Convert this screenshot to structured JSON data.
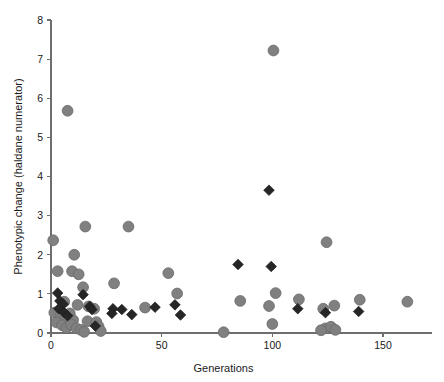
{
  "figure": {
    "caption_fragment": ""
  },
  "chart_data": {
    "type": "scatter",
    "title": "",
    "xlabel": "Generations",
    "ylabel": "Phenotypic change (haldane numerator)",
    "xlim": [
      0,
      175
    ],
    "ylim": [
      0,
      8
    ],
    "xticks": [
      0,
      50,
      100,
      150
    ],
    "yticks": [
      0,
      1,
      2,
      3,
      4,
      5,
      6,
      7,
      8
    ],
    "xtick_labels": [
      "0",
      "50",
      "100",
      "150"
    ],
    "ytick_labels": [
      "0",
      "1",
      "2",
      "3",
      "4",
      "5",
      "6",
      "7",
      "8"
    ],
    "grid": false,
    "legend": "none",
    "series": [
      {
        "name": "circles",
        "marker": "circle",
        "color": "#808080",
        "points": [
          [
            7.5,
            5.68
          ],
          [
            100.5,
            7.22
          ],
          [
            1.0,
            2.37
          ],
          [
            15.5,
            2.72
          ],
          [
            35.0,
            2.72
          ],
          [
            10.5,
            2.0
          ],
          [
            3.0,
            1.58
          ],
          [
            9.5,
            1.58
          ],
          [
            12.5,
            1.5
          ],
          [
            53.0,
            1.53
          ],
          [
            124.5,
            2.32
          ],
          [
            28.5,
            1.27
          ],
          [
            14.5,
            1.17
          ],
          [
            57.0,
            1.01
          ],
          [
            101.5,
            1.02
          ],
          [
            112.0,
            0.86
          ],
          [
            139.5,
            0.85
          ],
          [
            161.0,
            0.8
          ],
          [
            85.5,
            0.82
          ],
          [
            6.0,
            0.8
          ],
          [
            12.0,
            0.72
          ],
          [
            17.0,
            0.68
          ],
          [
            19.5,
            0.62
          ],
          [
            42.5,
            0.65
          ],
          [
            98.5,
            0.69
          ],
          [
            123.0,
            0.62
          ],
          [
            128.0,
            0.7
          ],
          [
            1.5,
            0.52
          ],
          [
            4.5,
            0.45
          ],
          [
            6.5,
            0.38
          ],
          [
            8.5,
            0.5
          ],
          [
            10.0,
            0.33
          ],
          [
            2.5,
            0.27
          ],
          [
            5.0,
            0.2
          ],
          [
            7.0,
            0.13
          ],
          [
            9.0,
            0.22
          ],
          [
            11.5,
            0.12
          ],
          [
            13.5,
            0.08
          ],
          [
            16.5,
            0.3
          ],
          [
            20.5,
            0.28
          ],
          [
            21.5,
            0.17
          ],
          [
            22.5,
            0.05
          ],
          [
            15.0,
            0.03
          ],
          [
            78.0,
            0.02
          ],
          [
            100.0,
            0.23
          ],
          [
            124.0,
            0.12
          ],
          [
            126.5,
            0.16
          ],
          [
            128.5,
            0.08
          ],
          [
            122.0,
            0.07
          ]
        ]
      },
      {
        "name": "diamonds",
        "marker": "diamond",
        "color": "#262626",
        "points": [
          [
            98.5,
            3.65
          ],
          [
            3.0,
            1.02
          ],
          [
            14.5,
            0.98
          ],
          [
            84.5,
            1.75
          ],
          [
            99.5,
            1.7
          ],
          [
            4.0,
            0.82
          ],
          [
            5.5,
            0.74
          ],
          [
            3.5,
            0.62
          ],
          [
            17.5,
            0.68
          ],
          [
            18.5,
            0.6
          ],
          [
            28.0,
            0.62
          ],
          [
            32.0,
            0.6
          ],
          [
            27.5,
            0.5
          ],
          [
            36.5,
            0.47
          ],
          [
            47.0,
            0.66
          ],
          [
            56.0,
            0.72
          ],
          [
            58.5,
            0.46
          ],
          [
            111.5,
            0.62
          ],
          [
            124.0,
            0.52
          ],
          [
            139.0,
            0.55
          ],
          [
            6.0,
            0.52
          ],
          [
            7.5,
            0.44
          ],
          [
            20.0,
            0.18
          ]
        ]
      }
    ]
  }
}
